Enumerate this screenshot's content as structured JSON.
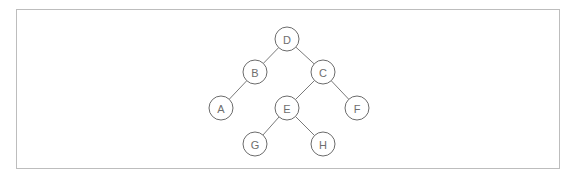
{
  "diagram": {
    "type": "binary-tree",
    "colors": {
      "frame_border": "#bdbdbd",
      "edge": "#6a6a6a",
      "node_stroke": "#5a5a5a",
      "node_fill": "#ffffff",
      "label": "#6e6e6e"
    },
    "node_radius": 12,
    "nodes": [
      {
        "id": "D",
        "label": "D",
        "x": 287,
        "y": 39
      },
      {
        "id": "B",
        "label": "B",
        "x": 255,
        "y": 72
      },
      {
        "id": "C",
        "label": "C",
        "x": 323,
        "y": 72
      },
      {
        "id": "A",
        "label": "A",
        "x": 221,
        "y": 108
      },
      {
        "id": "E",
        "label": "E",
        "x": 287,
        "y": 108
      },
      {
        "id": "F",
        "label": "F",
        "x": 357,
        "y": 108
      },
      {
        "id": "G",
        "label": "G",
        "x": 255,
        "y": 144
      },
      {
        "id": "H",
        "label": "H",
        "x": 323,
        "y": 144
      }
    ],
    "edges": [
      {
        "from": "D",
        "to": "B"
      },
      {
        "from": "D",
        "to": "C"
      },
      {
        "from": "B",
        "to": "A"
      },
      {
        "from": "C",
        "to": "E"
      },
      {
        "from": "C",
        "to": "F"
      },
      {
        "from": "E",
        "to": "G"
      },
      {
        "from": "E",
        "to": "H"
      }
    ]
  }
}
